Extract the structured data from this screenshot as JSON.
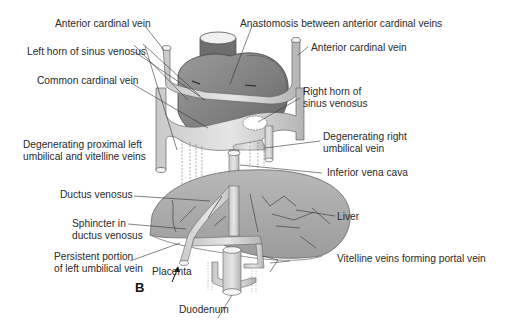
{
  "figure": {
    "panel_letter": "B",
    "labels": {
      "anterior_cardinal_vein_left": "Anterior cardinal vein",
      "anastomosis": "Anastomosis between anterior cardinal veins",
      "anterior_cardinal_vein_right": "Anterior cardinal vein",
      "left_horn": "Left horn of sinus venosus",
      "common_cardinal_vein": "Common cardinal vein",
      "right_horn_line1": "Right horn of",
      "right_horn_line2": "sinus venosus",
      "degen_left_line1": "Degenerating proximal left",
      "degen_left_line2": "umbilical and vitelline veins",
      "degen_right_line1": "Degenerating right",
      "degen_right_line2": "umbilical vein",
      "ivc": "Inferior vena cava",
      "ductus_venosus": "Ductus venosus",
      "liver": "Liver",
      "sphincter_line1": "Sphincter in",
      "sphincter_line2": "ductus venosus",
      "persistent_line1": "Persistent portion",
      "persistent_line2": "of left umbilical vein",
      "placenta": "Placenta",
      "vitelline_portal": "Vitelline veins forming portal vein",
      "duodenum": "Duodenum"
    }
  }
}
